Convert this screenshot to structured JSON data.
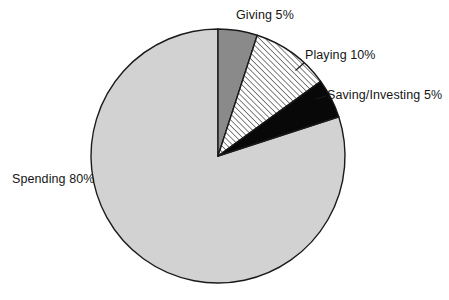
{
  "chart_data": {
    "type": "pie",
    "title": "",
    "subtitle": "",
    "xlabel": "",
    "ylabel": "",
    "legend_position": "none",
    "grid": false,
    "total": 100,
    "units": "%",
    "categories": [
      "Giving",
      "Playing",
      "Saving/Investing",
      "Spending"
    ],
    "values": [
      5,
      10,
      5,
      80
    ],
    "labels": [
      "Giving 5%",
      "Playing 10%",
      "Saving/Investing 5%",
      "Spending 80%"
    ],
    "slices": [
      {
        "name": "Giving",
        "value": 5,
        "label": "Giving 5%",
        "fill": "#8a8a8a",
        "pattern": "solid",
        "stroke": "#1a1a1a",
        "start_angle": 0,
        "end_angle": 18,
        "label_position": "top"
      },
      {
        "name": "Playing",
        "value": 10,
        "label": "Playing 10%",
        "fill": "#ffffff",
        "pattern": "diagonal-hatch",
        "stroke": "#1a1a1a",
        "start_angle": 18,
        "end_angle": 54,
        "label_position": "top-right"
      },
      {
        "name": "Saving/Investing",
        "value": 5,
        "label": "Saving/Investing 5%",
        "fill": "#080808",
        "pattern": "solid",
        "stroke": "#1a1a1a",
        "start_angle": 54,
        "end_angle": 72,
        "label_position": "right"
      },
      {
        "name": "Spending",
        "value": 80,
        "label": "Spending 80%",
        "fill": "#d2d2d2",
        "pattern": "solid",
        "stroke": "#1a1a1a",
        "start_angle": 72,
        "end_angle": 360,
        "label_position": "left"
      }
    ],
    "geometry": {
      "center_x": 218,
      "center_y": 156,
      "radius": 127
    },
    "colors": {
      "giving": "#8a8a8a",
      "playing": "#ffffff",
      "saving_investing": "#080808",
      "spending": "#d2d2d2",
      "outline": "#1a1a1a",
      "text": "#151515",
      "background": "#ffffff"
    }
  }
}
